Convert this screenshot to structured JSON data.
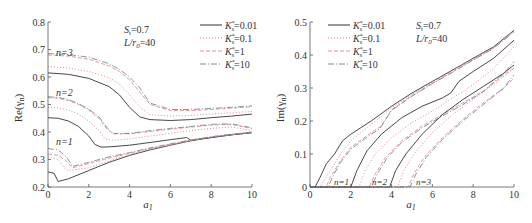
{
  "chart_data": [
    {
      "type": "line",
      "title": "",
      "xlabel": "a1",
      "ylabel": "Re(γn)",
      "xlim": [
        0,
        10
      ],
      "ylim": [
        0.2,
        0.8
      ],
      "xticks": [
        0,
        2,
        4,
        6,
        8,
        10
      ],
      "yticks": [
        0.2,
        0.3,
        0.4,
        0.5,
        0.6,
        0.7,
        0.8
      ],
      "grid": false,
      "legend_position": "upper right",
      "annotations": [
        "St=0.7",
        "L/r0=40",
        "n=1",
        "n=2",
        "n=3"
      ],
      "legend": [
        "Ks*=0.01",
        "Ks*=0.1",
        "Ks*=1",
        "Ks*=10"
      ],
      "series": [
        {
          "name": "n=3, Ks*=0.01",
          "x": [
            0,
            1,
            2,
            3,
            3.5,
            4,
            4.5,
            5,
            6,
            7,
            8,
            9,
            10
          ],
          "values": [
            0.615,
            0.61,
            0.595,
            0.565,
            0.535,
            0.49,
            0.455,
            0.445,
            0.442,
            0.445,
            0.452,
            0.458,
            0.465
          ]
        },
        {
          "name": "n=3, Ks*=0.1",
          "x": [
            0,
            1,
            2,
            3,
            3.5,
            4,
            4.5,
            5,
            6,
            7,
            8,
            9,
            10
          ],
          "values": [
            0.638,
            0.633,
            0.62,
            0.598,
            0.575,
            0.535,
            0.49,
            0.463,
            0.458,
            0.46,
            0.466,
            0.47,
            0.475
          ]
        },
        {
          "name": "n=3, Ks*=1",
          "x": [
            0,
            1,
            2,
            3,
            3.5,
            4,
            4.5,
            5,
            6,
            7,
            8,
            9,
            10
          ],
          "values": [
            0.68,
            0.676,
            0.665,
            0.64,
            0.62,
            0.59,
            0.545,
            0.5,
            0.478,
            0.478,
            0.482,
            0.487,
            0.492
          ]
        },
        {
          "name": "n=3, Ks*=10",
          "x": [
            0,
            1,
            2,
            3,
            3.5,
            4,
            4.5,
            5,
            6,
            7,
            8,
            9,
            10
          ],
          "values": [
            0.685,
            0.682,
            0.672,
            0.648,
            0.628,
            0.6,
            0.56,
            0.505,
            0.482,
            0.482,
            0.486,
            0.49,
            0.495
          ]
        },
        {
          "name": "n=2, Ks*=0.01",
          "x": [
            0,
            0.5,
            1,
            1.5,
            2,
            2.3,
            2.6,
            3,
            4,
            5,
            6,
            6.8,
            7,
            8,
            9,
            10
          ],
          "values": [
            0.452,
            0.45,
            0.44,
            0.42,
            0.385,
            0.355,
            0.345,
            0.346,
            0.352,
            0.362,
            0.372,
            0.38,
            0.37,
            0.38,
            0.39,
            0.398
          ]
        },
        {
          "name": "n=2, Ks*=0.1",
          "x": [
            0,
            0.5,
            1,
            1.5,
            2,
            2.5,
            2.8,
            3.2,
            4,
            5,
            6,
            7,
            8,
            9,
            10
          ],
          "values": [
            0.49,
            0.488,
            0.48,
            0.465,
            0.44,
            0.405,
            0.375,
            0.37,
            0.375,
            0.385,
            0.395,
            0.405,
            0.413,
            0.418,
            0.405
          ]
        },
        {
          "name": "n=2, Ks*=1",
          "x": [
            0,
            0.5,
            1,
            1.5,
            2,
            2.5,
            2.9,
            3.2,
            4,
            5,
            6,
            7,
            8,
            9,
            10
          ],
          "values": [
            0.525,
            0.523,
            0.515,
            0.5,
            0.48,
            0.45,
            0.41,
            0.393,
            0.393,
            0.402,
            0.41,
            0.418,
            0.425,
            0.428,
            0.412
          ]
        },
        {
          "name": "n=2, Ks*=10",
          "x": [
            0,
            0.5,
            1,
            1.5,
            2,
            2.5,
            2.9,
            3.2,
            4,
            5,
            6,
            7,
            8,
            9,
            10
          ],
          "values": [
            0.528,
            0.526,
            0.518,
            0.503,
            0.483,
            0.455,
            0.415,
            0.395,
            0.395,
            0.405,
            0.413,
            0.42,
            0.428,
            0.43,
            0.415
          ]
        },
        {
          "name": "n=1, Ks*=0.01",
          "x": [
            0,
            0.3,
            0.5,
            1,
            2,
            3,
            4,
            5,
            6,
            7,
            8,
            9,
            10
          ],
          "values": [
            0.255,
            0.25,
            0.22,
            0.23,
            0.26,
            0.29,
            0.315,
            0.335,
            0.352,
            0.368,
            0.38,
            0.39,
            0.398
          ]
        },
        {
          "name": "n=1, Ks*=0.1",
          "x": [
            0,
            0.5,
            0.8,
            1,
            2,
            3,
            4,
            5,
            6,
            7,
            8,
            9,
            10
          ],
          "values": [
            0.31,
            0.3,
            0.27,
            0.26,
            0.27,
            0.295,
            0.318,
            0.337,
            0.353,
            0.368,
            0.38,
            0.39,
            0.398
          ]
        },
        {
          "name": "n=1, Ks*=1",
          "x": [
            0,
            0.5,
            0.9,
            1.2,
            2,
            3,
            4,
            5,
            6,
            7,
            8,
            9,
            10
          ],
          "values": [
            0.32,
            0.315,
            0.295,
            0.27,
            0.285,
            0.305,
            0.322,
            0.34,
            0.355,
            0.37,
            0.382,
            0.391,
            0.399
          ]
        },
        {
          "name": "n=1, Ks*=10",
          "x": [
            0,
            0.5,
            0.9,
            1.2,
            2,
            3,
            4,
            5,
            6,
            7,
            8,
            9,
            10
          ],
          "values": [
            0.34,
            0.335,
            0.31,
            0.275,
            0.29,
            0.31,
            0.325,
            0.342,
            0.357,
            0.371,
            0.383,
            0.392,
            0.4
          ]
        }
      ]
    },
    {
      "type": "line",
      "title": "",
      "xlabel": "a1",
      "ylabel": "Im(γn)",
      "xlim": [
        0,
        10
      ],
      "ylim": [
        0,
        0.5
      ],
      "xticks": [
        0,
        2,
        4,
        6,
        8,
        10
      ],
      "yticks": [
        0,
        0.1,
        0.2,
        0.3,
        0.4,
        0.5
      ],
      "grid": false,
      "legend_position": "upper left",
      "annotations": [
        "St=0.7",
        "L/r0=40",
        "n=1",
        "n=2",
        "n=3"
      ],
      "legend": [
        "Ks*=0.01",
        "Ks*=0.1",
        "Ks*=1",
        "Ks*=10"
      ],
      "series": [
        {
          "name": "n=1, Ks*=0.01",
          "x": [
            0,
            0.25,
            0.5,
            0.8,
            1.2,
            1.6,
            2,
            3,
            4,
            5,
            6,
            7,
            8,
            9,
            10
          ],
          "values": [
            0,
            0,
            0.03,
            0.07,
            0.1,
            0.14,
            0.16,
            0.2,
            0.245,
            0.285,
            0.32,
            0.355,
            0.39,
            0.425,
            0.475
          ]
        },
        {
          "name": "n=1, Ks*=0.1",
          "x": [
            0,
            0.5,
            0.7,
            1,
            1.5,
            2,
            3,
            4,
            5,
            6,
            7,
            8,
            9,
            10
          ],
          "values": [
            0,
            0,
            0.02,
            0.05,
            0.1,
            0.14,
            0.19,
            0.24,
            0.28,
            0.318,
            0.353,
            0.388,
            0.423,
            0.473
          ]
        },
        {
          "name": "n=1, Ks*=1",
          "x": [
            0,
            0.8,
            1,
            1.5,
            2,
            3,
            3.5,
            4,
            5,
            6,
            7,
            8,
            9,
            10
          ],
          "values": [
            0,
            0,
            0.03,
            0.08,
            0.12,
            0.165,
            0.185,
            0.235,
            0.277,
            0.315,
            0.35,
            0.386,
            0.421,
            0.472
          ]
        },
        {
          "name": "n=1, Ks*=10",
          "x": [
            0,
            0.9,
            1.1,
            1.5,
            2,
            3,
            3.4,
            4,
            5,
            6,
            7,
            8,
            9,
            10
          ],
          "values": [
            0,
            0,
            0.03,
            0.075,
            0.115,
            0.16,
            0.175,
            0.232,
            0.275,
            0.313,
            0.348,
            0.385,
            0.42,
            0.47
          ]
        },
        {
          "name": "n=2, Ks*=0.01",
          "x": [
            0,
            2,
            2.3,
            2.8,
            3.5,
            4.5,
            5.5,
            6.5,
            6.9,
            7.3,
            8,
            9,
            10
          ],
          "values": [
            0,
            0,
            0.05,
            0.11,
            0.16,
            0.21,
            0.245,
            0.27,
            0.285,
            0.32,
            0.35,
            0.39,
            0.445
          ]
        },
        {
          "name": "n=2, Ks*=0.1",
          "x": [
            0,
            2.4,
            2.7,
            3.2,
            4,
            5,
            6,
            7,
            8,
            9,
            10
          ],
          "values": [
            0,
            0,
            0.05,
            0.1,
            0.15,
            0.195,
            0.23,
            0.27,
            0.31,
            0.36,
            0.425
          ]
        },
        {
          "name": "n=2, Ks*=1",
          "x": [
            0,
            2.9,
            3.2,
            3.7,
            4.5,
            5.5,
            6.5,
            7.5,
            8.5,
            9.5,
            10
          ],
          "values": [
            0,
            0,
            0.04,
            0.09,
            0.14,
            0.185,
            0.22,
            0.255,
            0.29,
            0.34,
            0.36
          ]
        },
        {
          "name": "n=2, Ks*=10",
          "x": [
            0,
            3,
            3.3,
            3.8,
            4.5,
            5.5,
            6.5,
            7.5,
            8.5,
            9.5,
            10
          ],
          "values": [
            0,
            0,
            0.04,
            0.09,
            0.135,
            0.18,
            0.215,
            0.25,
            0.29,
            0.345,
            0.38
          ]
        },
        {
          "name": "n=3, Ks*=0.01",
          "x": [
            0,
            3.9,
            4.2,
            4.7,
            5.5,
            6.5,
            7.5,
            8.5,
            9.5,
            10
          ],
          "values": [
            0,
            0,
            0.05,
            0.1,
            0.16,
            0.22,
            0.265,
            0.305,
            0.345,
            0.37
          ]
        },
        {
          "name": "n=3, Ks*=0.1",
          "x": [
            0,
            4.3,
            4.6,
            5.1,
            6,
            7,
            8,
            9,
            10
          ],
          "values": [
            0,
            0,
            0.05,
            0.1,
            0.165,
            0.22,
            0.265,
            0.31,
            0.36
          ]
        },
        {
          "name": "n=3, Ks*=1",
          "x": [
            0,
            4.8,
            5.1,
            5.6,
            6.5,
            7.5,
            8.5,
            9.5,
            10
          ],
          "values": [
            0,
            0,
            0.04,
            0.09,
            0.15,
            0.205,
            0.255,
            0.3,
            0.33
          ]
        },
        {
          "name": "n=3, Ks*=10",
          "x": [
            0,
            4.9,
            5.2,
            5.7,
            6.5,
            7.5,
            8.5,
            9.5,
            10
          ],
          "values": [
            0,
            0,
            0.04,
            0.09,
            0.145,
            0.2,
            0.25,
            0.3,
            0.34
          ]
        }
      ]
    }
  ],
  "left_chart": {
    "ylabel": "Re(γ",
    "ylabel_sub": "n",
    "xlabel": "a",
    "xlabel_sub": "1",
    "yticks": [
      "0.2",
      "0.3",
      "0.4",
      "0.5",
      "0.6",
      "0.7",
      "0.8"
    ],
    "xticks": [
      "0",
      "2",
      "4",
      "6",
      "8",
      "10"
    ],
    "param_St": "S",
    "param_St_sub": "t",
    "param_St_val": "=0.7",
    "param_L": "L/r",
    "param_L_sub": "0",
    "param_L_val": "=40",
    "mode_labels": [
      "n=3",
      "n=2",
      "n=1"
    ]
  },
  "right_chart": {
    "ylabel": "Im(γ",
    "ylabel_sub": "n",
    "xlabel": "a",
    "xlabel_sub": "1",
    "yticks": [
      "0",
      "0.1",
      "0.2",
      "0.3",
      "0.4",
      "0.5"
    ],
    "xticks": [
      "0",
      "2",
      "4",
      "6",
      "8",
      "10"
    ],
    "param_St": "S",
    "param_St_sub": "t",
    "param_St_val": "=0.7",
    "param_L": "L/r",
    "param_L_sub": "0",
    "param_L_val": "=40",
    "mode_labels": [
      "n=1",
      "n=2",
      "n=3"
    ]
  },
  "legend": [
    {
      "sym": "K",
      "sup": "*",
      "sub": "s",
      "val": "=0.01",
      "style": "solid",
      "color": "#333333"
    },
    {
      "sym": "K",
      "sup": "*",
      "sub": "s",
      "val": "=0.1",
      "style": "dotted",
      "color": "#d98080"
    },
    {
      "sym": "K",
      "sup": "*",
      "sub": "s",
      "val": "=1",
      "style": "dashed",
      "color": "#e09090"
    },
    {
      "sym": "K",
      "sup": "*",
      "sub": "s",
      "val": "=10",
      "style": "dashdot",
      "color": "#7a8a9a"
    }
  ]
}
